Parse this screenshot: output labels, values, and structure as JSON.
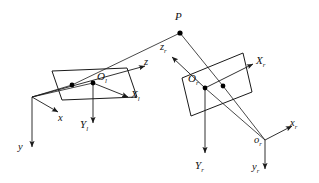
{
  "figure": {
    "type": "stereo-vision-geometry-diagram",
    "title": "",
    "background_color": "#ffffff",
    "stroke_color": "#1a1a1a",
    "point_color": "#000000",
    "width": 319,
    "height": 183
  },
  "labels": {
    "scene_point": {
      "base": "P",
      "sub": ""
    },
    "left_image_origin": {
      "base": "O",
      "sub": "l"
    },
    "left_image_x_axis": {
      "base": "X",
      "sub": "l"
    },
    "left_image_y_axis": {
      "base": "Y",
      "sub": "l"
    },
    "world_x_axis": {
      "base": "x",
      "sub": ""
    },
    "world_y_axis": {
      "base": "y",
      "sub": ""
    },
    "world_z_axis": {
      "base": "z",
      "sub": ""
    },
    "right_image_origin": {
      "base": "O",
      "sub": "r"
    },
    "right_image_x_axis": {
      "base": "X",
      "sub": "r"
    },
    "right_image_y_axis": {
      "base": "Y",
      "sub": "r"
    },
    "right_camera_origin": {
      "base": "o",
      "sub": "r"
    },
    "right_camera_x_axis": {
      "base": "x",
      "sub": "r"
    },
    "right_camera_y_axis": {
      "base": "y",
      "sub": "r"
    },
    "right_camera_z_axis": {
      "base": "z",
      "sub": "r"
    }
  },
  "geometry": {
    "left_image_plane": "52,71 127,68 137,97 62,100",
    "right_image_plane": "182,78 243,53 252,92 191,116",
    "scene_point": {
      "x": 180,
      "y": 33
    },
    "left_principal_point": {
      "x": 93,
      "y": 83
    },
    "left_projected_point": {
      "x": 72,
      "y": 85
    },
    "right_principal_point": {
      "x": 205,
      "y": 88
    },
    "right_projected_point": {
      "x": 223,
      "y": 86
    },
    "world_origin": {
      "x": 32,
      "y": 97
    },
    "right_camera_origin": {
      "x": 265,
      "y": 140
    }
  }
}
